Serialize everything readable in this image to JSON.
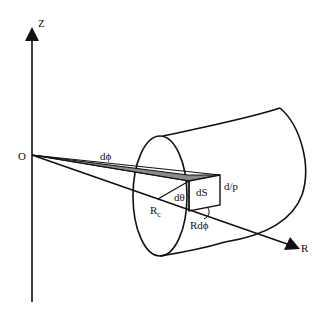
{
  "diagram": {
    "labels": {
      "z_axis": "Z",
      "r_axis": "R",
      "origin": "O",
      "d_phi": "dϕ",
      "d_theta": "dθ",
      "d_s": "dS",
      "d_l_p": "d/p",
      "r_c": "R",
      "r_c_sub": "c",
      "r_d_phi": "Rdϕ"
    },
    "colors": {
      "stroke": "#111111",
      "wedge_fill": "#8a8a8a",
      "background": "#ffffff"
    }
  }
}
